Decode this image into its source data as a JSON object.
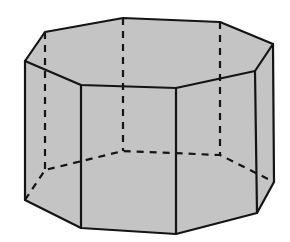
{
  "diagram": {
    "title": "",
    "type": "octagonal-prism",
    "colors": {
      "fill": "#c4c4c4",
      "stroke": "#141414",
      "background": "#ffffff"
    },
    "stroke_width": 2.2,
    "dash_pattern": "7,6",
    "visible_faces": [
      {
        "name": "top-face",
        "points": "25,61 45,32 123,18 220,22 273,44 255,71 176,88 81,85"
      },
      {
        "name": "front-left-face",
        "points": "25,61 81,85 81,228 25,200"
      },
      {
        "name": "front-center-face",
        "points": "81,85 176,88 176,234 81,228"
      },
      {
        "name": "front-right-face",
        "points": "176,88 255,71 257,213 176,234"
      },
      {
        "name": "right-face",
        "points": "255,71 273,44 274,182 257,213"
      }
    ],
    "solid_edges": [
      {
        "name": "top-edge",
        "points": "25,61 45,32 123,18 220,22 273,44 255,71 176,88 81,85 25,61"
      },
      {
        "name": "bottom-front-edge",
        "points": "25,200 81,228 176,234 257,213 274,182"
      },
      {
        "name": "vertical-edge-1",
        "points": "25,61 25,200"
      },
      {
        "name": "vertical-edge-2",
        "points": "81,85 81,228"
      },
      {
        "name": "vertical-edge-3",
        "points": "176,88 176,234"
      },
      {
        "name": "vertical-edge-4",
        "points": "255,71 257,213"
      },
      {
        "name": "vertical-edge-5",
        "points": "273,44 274,182"
      }
    ],
    "hidden_edges": [
      {
        "name": "hidden-vertical-1",
        "points": "45,32 45,170"
      },
      {
        "name": "hidden-vertical-2",
        "points": "123,18 123,151"
      },
      {
        "name": "hidden-vertical-3",
        "points": "220,22 220,155"
      },
      {
        "name": "hidden-bottom-back",
        "points": "25,200 45,170 123,151 220,155 274,182"
      }
    ]
  }
}
